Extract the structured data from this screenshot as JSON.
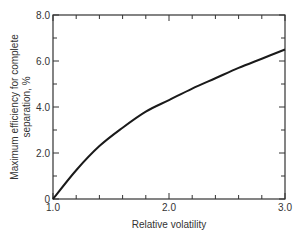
{
  "chart_data": {
    "type": "line",
    "title": "",
    "xlabel": "Relative volatility",
    "ylabel_lines": [
      "Maximum efficiency for complete",
      "separation, %"
    ],
    "ylabel": "Maximum efficiency for complete separation, %",
    "xlim": [
      1.0,
      3.0
    ],
    "ylim": [
      0,
      8.0
    ],
    "x_ticks": [
      {
        "value": 1.0,
        "label": "1.0"
      },
      {
        "value": 2.0,
        "label": "2.0"
      },
      {
        "value": 3.0,
        "label": "3.0"
      }
    ],
    "y_ticks": [
      {
        "value": 0,
        "label": "0"
      },
      {
        "value": 2.0,
        "label": "2.0"
      },
      {
        "value": 4.0,
        "label": "4.0"
      },
      {
        "value": 6.0,
        "label": "6.0"
      },
      {
        "value": 8.0,
        "label": "8.0"
      }
    ],
    "x_minor_step": 0.2,
    "y_minor_step": 1.0,
    "grid": false,
    "series": [
      {
        "name": "Maximum efficiency",
        "x": [
          1.0,
          1.2,
          1.4,
          1.6,
          1.8,
          2.0,
          2.2,
          2.4,
          2.6,
          2.8,
          3.0
        ],
        "values": [
          0.0,
          1.25,
          2.3,
          3.1,
          3.8,
          4.3,
          4.8,
          5.25,
          5.7,
          6.1,
          6.5
        ]
      }
    ]
  },
  "colors": {
    "line": "#1a1a1a",
    "axis": "#333333"
  }
}
